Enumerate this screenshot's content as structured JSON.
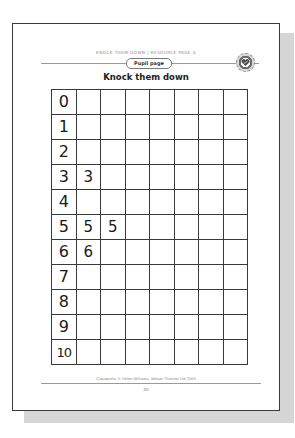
{
  "header": {
    "running_head": "Knock Them Down | Resource Page A",
    "section_pill": "Pupil page",
    "badge_icon": "heart-seal-icon"
  },
  "title": "Knock them down",
  "grid": {
    "columns": 8,
    "rows": [
      {
        "label": "0",
        "cells": [
          "",
          "",
          "",
          "",
          "",
          "",
          ""
        ]
      },
      {
        "label": "1",
        "cells": [
          "",
          "",
          "",
          "",
          "",
          "",
          ""
        ]
      },
      {
        "label": "2",
        "cells": [
          "",
          "",
          "",
          "",
          "",
          "",
          ""
        ]
      },
      {
        "label": "3",
        "cells": [
          "3",
          "",
          "",
          "",
          "",
          "",
          ""
        ]
      },
      {
        "label": "4",
        "cells": [
          "",
          "",
          "",
          "",
          "",
          "",
          ""
        ]
      },
      {
        "label": "5",
        "cells": [
          "5",
          "5",
          "",
          "",
          "",
          "",
          ""
        ]
      },
      {
        "label": "6",
        "cells": [
          "6",
          "",
          "",
          "",
          "",
          "",
          ""
        ]
      },
      {
        "label": "7",
        "cells": [
          "",
          "",
          "",
          "",
          "",
          "",
          ""
        ]
      },
      {
        "label": "8",
        "cells": [
          "",
          "",
          "",
          "",
          "",
          "",
          ""
        ]
      },
      {
        "label": "9",
        "cells": [
          "",
          "",
          "",
          "",
          "",
          "",
          ""
        ]
      },
      {
        "label": "10",
        "cells": [
          "",
          "",
          "",
          "",
          "",
          "",
          ""
        ]
      }
    ]
  },
  "footer": {
    "copyright": "Classworks © Helen Williams, Nelson Thornes Ltd 2003",
    "page_number": "30"
  },
  "colors": {
    "border": "#3a3a3a",
    "shadow": "#d6d6d6",
    "muted_text": "#8a8a8a"
  }
}
